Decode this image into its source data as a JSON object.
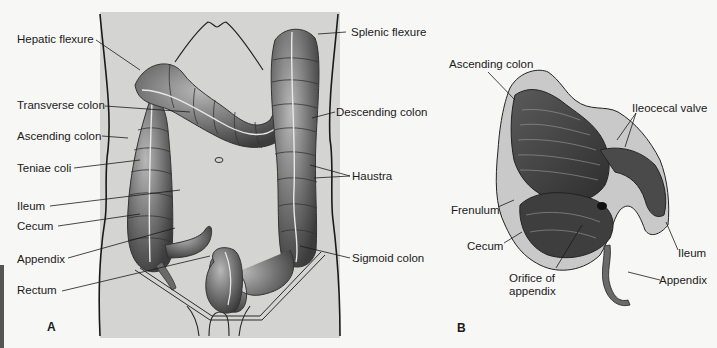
{
  "figure_a": {
    "panel_letter": "A",
    "labels": {
      "hepatic_flexure": "Hepatic flexure",
      "transverse_colon": "Transverse colon",
      "ascending_colon": "Ascending colon",
      "teniae_coli": "Teniae coli",
      "ileum": "Ileum",
      "cecum": "Cecum",
      "appendix": "Appendix",
      "rectum": "Rectum",
      "splenic_flexure": "Splenic flexure",
      "descending_colon": "Descending colon",
      "haustra": "Haustra",
      "sigmoid_colon": "Sigmoid colon"
    },
    "background_color": "#d4d4d2"
  },
  "figure_b": {
    "panel_letter": "B",
    "labels": {
      "ascending_colon": "Ascending colon",
      "ileocecal_valve": "Ileocecal valve",
      "frenulum": "Frenulum",
      "cecum": "Cecum",
      "orifice_line1": "Orifice of",
      "orifice_line2": "appendix",
      "ileum": "Ileum",
      "appendix": "Appendix"
    }
  }
}
